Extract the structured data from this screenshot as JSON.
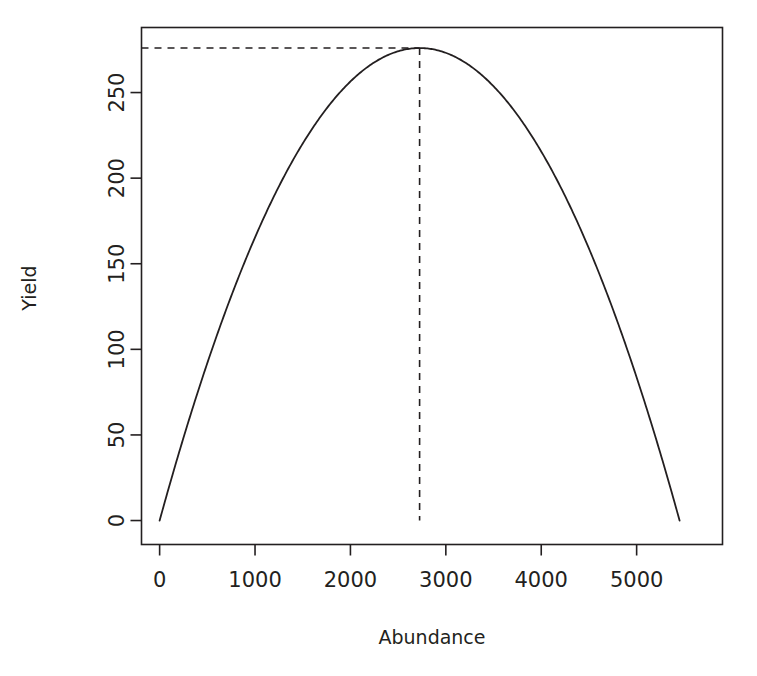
{
  "figure": {
    "title": "",
    "background_color": "#ffffff",
    "axis_color": "#231f20",
    "curve_color": "#231f20",
    "guide_color": "#231f20"
  },
  "chart_data": {
    "type": "line",
    "title": "",
    "xlabel": "Abundance",
    "ylabel": "Yield",
    "xlim": [
      -190,
      5900
    ],
    "ylim": [
      -14,
      288
    ],
    "xticks": [
      0,
      1000,
      2000,
      3000,
      4000,
      5000
    ],
    "xticklabels": [
      "0",
      "1000",
      "2000",
      "3000",
      "4000",
      "5000"
    ],
    "yticks": [
      0,
      50,
      100,
      150,
      200,
      250
    ],
    "yticklabels": [
      "0",
      "50",
      "100",
      "150",
      "200",
      "250"
    ],
    "grid": false,
    "legend": null,
    "series": [
      {
        "name": "Surplus production (Schaefer parabola)",
        "style": "solid",
        "x": [
          0,
          100,
          200,
          300,
          400,
          500,
          600,
          700,
          800,
          900,
          1000,
          1100,
          1200,
          1300,
          1400,
          1500,
          1600,
          1700,
          1800,
          1900,
          2000,
          2100,
          2200,
          2300,
          2400,
          2500,
          2600,
          2725,
          2800,
          2900,
          3000,
          3100,
          3200,
          3300,
          3400,
          3500,
          3600,
          3700,
          3800,
          3900,
          4000,
          4100,
          4200,
          4300,
          4400,
          4500,
          4600,
          4700,
          4800,
          4900,
          5000,
          5100,
          5200,
          5300,
          5400,
          5450
        ],
        "y": [
          0,
          19.8,
          38.8,
          57.0,
          74.4,
          91.0,
          106.8,
          121.8,
          136.0,
          149.4,
          162.0,
          173.8,
          184.8,
          195.0,
          204.4,
          213.0,
          220.8,
          227.8,
          234.0,
          239.4,
          244.0,
          247.8,
          250.8,
          253.0,
          254.4,
          255.0,
          255.8,
          276.0,
          274.4,
          271.6,
          267.4,
          262.0,
          255.4,
          247.6,
          238.6,
          228.4,
          217.0,
          204.4,
          190.6,
          175.6,
          159.4,
          142.0,
          123.4,
          103.6,
          82.6,
          60.4,
          37.0,
          12.4,
          0,
          0,
          0,
          0,
          0,
          0,
          0,
          0
        ]
      }
    ],
    "annotations": [
      {
        "name": "msy-vertical-guide",
        "style": "dashed",
        "orientation": "vertical",
        "x": 2725,
        "y_from": 0,
        "y_to": 276
      },
      {
        "name": "msy-horizontal-guide",
        "style": "dashed",
        "orientation": "horizontal",
        "y": 276,
        "x_from": -190,
        "x_to": 2725
      }
    ],
    "msy": {
      "abundance_at_msy": 2725,
      "maximum_yield": 276,
      "carrying_capacity": 5450
    }
  },
  "axes": {
    "x_axis_name": "abundance-axis",
    "y_axis_name": "yield-axis"
  }
}
